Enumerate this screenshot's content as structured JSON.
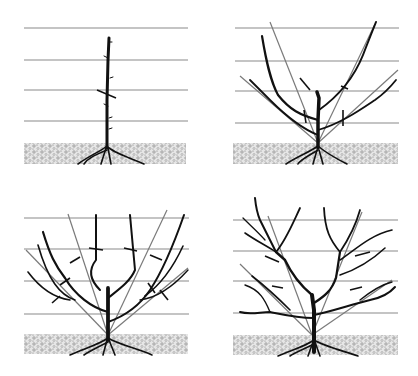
{
  "figure": {
    "title": "",
    "panels": [
      {
        "id": "stage-1",
        "label": "",
        "description": "Single whip planted with one heading cut"
      },
      {
        "id": "stage-2",
        "label": "",
        "description": "First-year scaffold branches tied to guide canes with cuts marked"
      },
      {
        "id": "stage-3",
        "label": "",
        "description": "Second-year framework with lateral branches and cuts"
      },
      {
        "id": "stage-4",
        "label": "",
        "description": "Mature open-centre tree framework"
      }
    ],
    "colors": {
      "wood": "#111111",
      "wire": "#8a8a8a",
      "guide_cane": "#7a7a7a",
      "soil": "#d9d9d9",
      "background": "#ffffff"
    }
  }
}
